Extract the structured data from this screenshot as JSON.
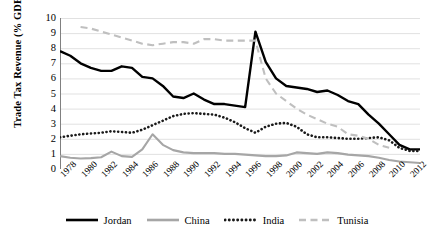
{
  "chart_data": {
    "type": "line",
    "title": "",
    "xlabel": "",
    "ylabel": "Trade Tax Revenue (% GDP)",
    "ylim": [
      0,
      10
    ],
    "yticks": [
      0,
      1,
      2,
      3,
      4,
      5,
      6,
      7,
      8,
      9,
      10
    ],
    "xlim": [
      1978,
      2013
    ],
    "xticks": [
      1978,
      1980,
      1982,
      1984,
      1986,
      1988,
      1990,
      1992,
      1994,
      1996,
      1998,
      2000,
      2002,
      2004,
      2006,
      2008,
      2010,
      2012
    ],
    "xtick_labels": [
      "1978",
      "1980",
      "1982",
      "1984",
      "1986",
      "1988",
      "1990",
      "1992",
      "1994",
      "1996",
      "1998",
      "2000",
      "2002",
      "2004",
      "2006",
      "2008",
      "2010",
      "2012"
    ],
    "minor_tick_interval": 1,
    "grid": "horizontal",
    "legend_position": "bottom",
    "x": [
      1978,
      1979,
      1980,
      1981,
      1982,
      1983,
      1984,
      1985,
      1986,
      1987,
      1988,
      1989,
      1990,
      1991,
      1992,
      1993,
      1994,
      1995,
      1996,
      1997,
      1998,
      1999,
      2000,
      2001,
      2002,
      2003,
      2004,
      2005,
      2006,
      2007,
      2008,
      2009,
      2010,
      2011,
      2012,
      2013
    ],
    "series": [
      {
        "name": "Jordan",
        "color": "#000000",
        "style": "solid",
        "values": [
          7.8,
          7.5,
          7.0,
          6.7,
          6.5,
          6.5,
          6.8,
          6.7,
          6.1,
          6.0,
          5.5,
          4.8,
          4.7,
          5.0,
          4.6,
          4.3,
          4.3,
          4.2,
          4.1,
          9.1,
          7.1,
          6.0,
          5.5,
          5.4,
          5.3,
          5.1,
          5.2,
          4.9,
          4.5,
          4.3,
          3.6,
          3.0,
          2.3,
          1.6,
          1.3,
          1.3
        ]
      },
      {
        "name": "China",
        "color": "#a6a6a6",
        "style": "solid",
        "values": [
          0.85,
          0.75,
          0.7,
          0.72,
          0.78,
          1.15,
          0.85,
          0.8,
          1.3,
          2.3,
          1.6,
          1.25,
          1.1,
          1.05,
          1.05,
          1.05,
          1.0,
          1.0,
          0.95,
          0.9,
          0.85,
          0.85,
          0.9,
          1.1,
          1.05,
          1.0,
          1.1,
          1.05,
          0.95,
          0.9,
          0.85,
          0.75,
          0.6,
          0.5,
          0.45,
          0.4
        ]
      },
      {
        "name": "India",
        "color": "#1a1a1a",
        "style": "dotted",
        "values": [
          2.1,
          2.2,
          2.3,
          2.35,
          2.4,
          2.5,
          2.45,
          2.4,
          2.6,
          2.9,
          3.2,
          3.5,
          3.65,
          3.7,
          3.65,
          3.6,
          3.4,
          3.1,
          2.7,
          2.4,
          2.8,
          3.0,
          3.05,
          2.8,
          2.3,
          2.1,
          2.1,
          2.05,
          2.0,
          2.0,
          2.05,
          2.1,
          1.9,
          1.4,
          1.2,
          1.2
        ]
      },
      {
        "name": "Tunisia",
        "color": "#bfbfbf",
        "style": "dashed",
        "values": [
          null,
          null,
          9.4,
          9.3,
          9.1,
          8.9,
          8.7,
          8.5,
          8.3,
          8.2,
          8.3,
          8.4,
          8.4,
          8.3,
          8.6,
          8.6,
          8.5,
          8.5,
          8.5,
          8.5,
          6.0,
          5.0,
          4.5,
          4.0,
          3.6,
          3.3,
          3.0,
          2.8,
          2.3,
          2.2,
          2.0,
          1.6,
          1.4,
          null,
          null,
          null
        ]
      }
    ]
  },
  "legend": {
    "items": [
      {
        "label": "Jordan"
      },
      {
        "label": "China"
      },
      {
        "label": "India"
      },
      {
        "label": "Tunisia"
      }
    ]
  }
}
